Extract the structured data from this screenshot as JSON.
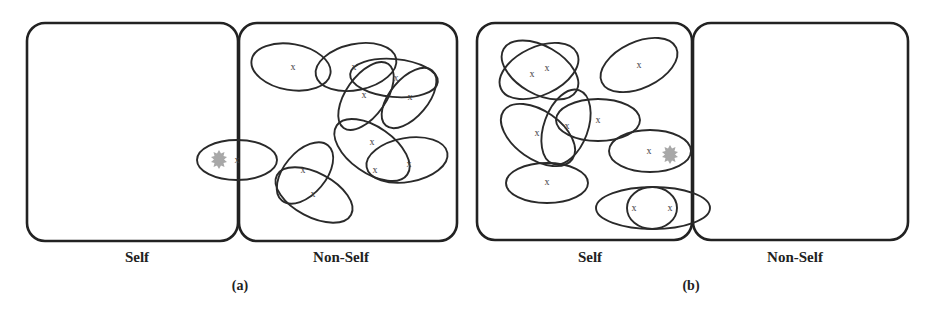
{
  "figure": {
    "panels": [
      {
        "caption": "(a)",
        "regions": [
          {
            "label": "Self",
            "detectors": 0
          },
          {
            "label": "Non-Self",
            "detectors": 9
          }
        ],
        "anomaly_marker": "star-icon",
        "detector_center_marker": "x"
      },
      {
        "caption": "(b)",
        "regions": [
          {
            "label": "Self",
            "detectors": 9
          },
          {
            "label": "Non-Self",
            "detectors": 0
          }
        ],
        "anomaly_marker": "star-icon",
        "detector_center_marker": "x"
      }
    ]
  },
  "labels": {
    "a_self": "Self",
    "a_nonself": "Non-Self",
    "a_caption": "(a)",
    "b_self": "Self",
    "b_nonself": "Non-Self",
    "b_caption": "(b)",
    "x": "x"
  }
}
